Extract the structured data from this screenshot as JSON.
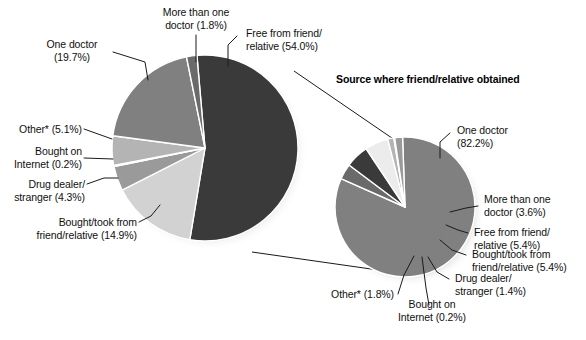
{
  "figure": {
    "background": "#ffffff",
    "width": 586,
    "height": 340,
    "subtitle": "Source where friend/relative obtained",
    "footnote_marker": "*"
  },
  "chart_data": {
    "type": "pie",
    "title": "",
    "charts": [
      {
        "name": "main-pie",
        "title": "",
        "center": [
          205,
          148
        ],
        "radius": 93,
        "start_angle_deg": -5,
        "categories": [
          "Free from friend/relative",
          "Bought/took from friend/relative",
          "Drug dealer/stranger",
          "Bought on Internet",
          "Other*",
          "One doctor",
          "More than one doctor"
        ],
        "values": [
          54.0,
          14.9,
          4.3,
          0.2,
          5.1,
          19.7,
          1.8
        ],
        "labels": [
          "Free from friend/\nrelative (54.0%)",
          "Bought/took from\nfriend/relative (14.9%)",
          "Drug dealer/\nstranger (4.3%)",
          "Bought on\nInternet (0.2%)",
          "Other* (5.1%)",
          "One doctor\n(19.7%)",
          "More than one\ndoctor (1.8%)"
        ],
        "colors": [
          "#3a3a3a",
          "#d2d2d2",
          "#9a9a9a",
          "#f0f0f0",
          "#b4b4b4",
          "#808080",
          "#6a6a6a"
        ]
      },
      {
        "name": "detail-pie",
        "title": "Source where friend/relative obtained",
        "center": [
          405,
          207
        ],
        "radius": 70,
        "start_angle_deg": -2,
        "categories": [
          "One doctor",
          "More than one doctor",
          "Free from friend/relative",
          "Bought/took from friend/relative",
          "Drug dealer/stranger",
          "Bought on Internet",
          "Other*"
        ],
        "values": [
          82.2,
          3.6,
          5.4,
          5.4,
          1.4,
          0.2,
          1.8
        ],
        "labels": [
          "One doctor\n(82.2%)",
          "More than one\ndoctor (3.6%)",
          "Free from friend/\nrelative (5.4%)",
          "Bought/took from\nfriend/relative (5.4%)",
          "Drug dealer/\nstranger (1.4%)",
          "Bought on\nInternet (0.2%)",
          "Other* (1.8%)"
        ],
        "colors": [
          "#808080",
          "#6a6a6a",
          "#3a3a3a",
          "#ececec",
          "#b4b4b4",
          "#f4f4f4",
          "#9a9a9a"
        ]
      }
    ]
  },
  "left_labels": {
    "more_than_one_doctor": "More than one\ndoctor (1.8%)",
    "free_from_friend": "Free from friend/\nrelative (54.0%)",
    "one_doctor": "One doctor\n(19.7%)",
    "other": "Other* (5.1%)",
    "bought_on_internet": "Bought on\nInternet (0.2%)",
    "drug_dealer": "Drug dealer/\nstranger (4.3%)",
    "bought_took_from_friend": "Bought/took from\nfriend/relative (14.9%)"
  },
  "right_labels": {
    "one_doctor": "One doctor\n(82.2%)",
    "more_than_one_doctor": "More than one\ndoctor (3.6%)",
    "free_from_friend": "Free from friend/\nrelative (5.4%)",
    "bought_took_from_friend": "Bought/took from\nfriend/relative (5.4%)",
    "drug_dealer": "Drug dealer/\nstranger (1.4%)",
    "bought_on_internet": "Bought on\nInternet (0.2%)",
    "other": "Other* (1.8%)"
  }
}
